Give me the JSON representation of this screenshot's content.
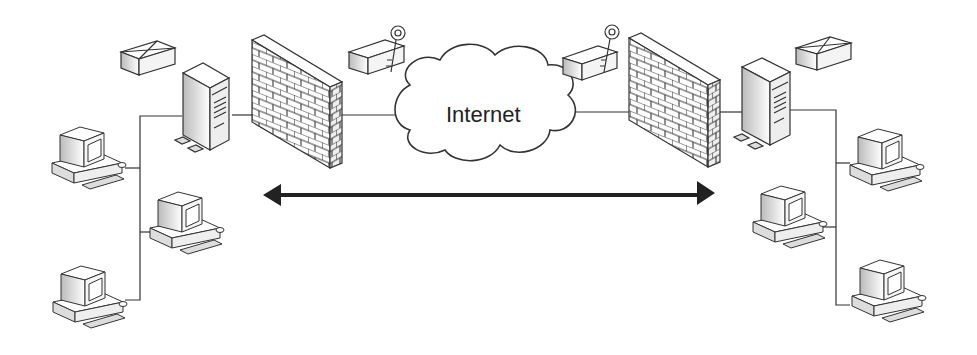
{
  "diagram": {
    "type": "network",
    "cloud_label": "Internet",
    "nodes": [
      {
        "id": "left-envelope",
        "kind": "envelope"
      },
      {
        "id": "left-server",
        "kind": "server"
      },
      {
        "id": "left-firewall",
        "kind": "firewall"
      },
      {
        "id": "left-encrypted-envelope",
        "kind": "envelope-with-key"
      },
      {
        "id": "internet-cloud",
        "kind": "cloud",
        "label": "Internet"
      },
      {
        "id": "right-encrypted-envelope",
        "kind": "envelope-with-key"
      },
      {
        "id": "right-firewall",
        "kind": "firewall"
      },
      {
        "id": "right-server",
        "kind": "server"
      },
      {
        "id": "right-envelope",
        "kind": "envelope"
      },
      {
        "id": "left-pc-1",
        "kind": "workstation"
      },
      {
        "id": "left-pc-2",
        "kind": "workstation"
      },
      {
        "id": "left-pc-3",
        "kind": "workstation"
      },
      {
        "id": "right-pc-1",
        "kind": "workstation"
      },
      {
        "id": "right-pc-2",
        "kind": "workstation"
      },
      {
        "id": "right-pc-3",
        "kind": "workstation"
      }
    ],
    "edges": [
      [
        "left-pc-1",
        "left-server"
      ],
      [
        "left-pc-2",
        "left-server"
      ],
      [
        "left-pc-3",
        "left-server"
      ],
      [
        "left-server",
        "left-firewall"
      ],
      [
        "left-firewall",
        "internet-cloud"
      ],
      [
        "internet-cloud",
        "right-firewall"
      ],
      [
        "right-firewall",
        "right-server"
      ],
      [
        "right-server",
        "right-pc-1"
      ],
      [
        "right-server",
        "right-pc-2"
      ],
      [
        "right-server",
        "right-pc-3"
      ]
    ],
    "arrow": {
      "kind": "bidirectional",
      "between": [
        "left-firewall",
        "right-firewall"
      ]
    }
  },
  "colors": {
    "line": "#333333",
    "fill": "#ffffff",
    "shade": "#cccccc",
    "arrow": "#222222"
  }
}
